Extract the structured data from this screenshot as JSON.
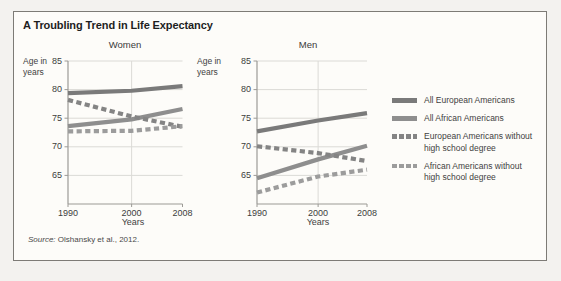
{
  "figure": {
    "title": "A Troubling Trend in Life Expectancy",
    "source_prefix": "Source:",
    "source_text": " Olshansky et al., 2012."
  },
  "colors": {
    "all_european": "#7a7a7a",
    "all_african": "#8e8e8e",
    "european_no_hs": "#848484",
    "african_no_hs": "#9c9c9c",
    "grid": "#dbdad6",
    "axis": "#9c9a96"
  },
  "legend": {
    "items": [
      {
        "label": "All European Americans",
        "style": "solid",
        "color_key": "all_european"
      },
      {
        "label": "All African Americans",
        "style": "solid",
        "color_key": "all_african"
      },
      {
        "label": "European Americans without\nhigh school degree",
        "style": "dashed",
        "color_key": "european_no_hs"
      },
      {
        "label": "African Americans without\nhigh school degree",
        "style": "dashed",
        "color_key": "african_no_hs"
      }
    ]
  },
  "chart_data": [
    {
      "type": "line",
      "title": "Women",
      "ylabel": "Age in\nyears",
      "xlabel": "Years",
      "x": [
        1990,
        2000,
        2008
      ],
      "x_tick_labels": [
        "1990",
        "2000",
        "2008"
      ],
      "y_ticks": [
        85,
        80,
        75,
        70,
        65
      ],
      "xlim": [
        1990,
        2008
      ],
      "ylim": [
        60,
        85
      ],
      "grid": true,
      "series": [
        {
          "name": "All European Americans",
          "style": "solid",
          "color_key": "all_european",
          "values": [
            79.4,
            79.8,
            80.6
          ]
        },
        {
          "name": "All African Americans",
          "style": "solid",
          "color_key": "all_african",
          "values": [
            73.6,
            74.8,
            76.6
          ]
        },
        {
          "name": "European Americans without high school degree",
          "style": "dashed",
          "color_key": "european_no_hs",
          "values": [
            78.2,
            75.3,
            73.5
          ]
        },
        {
          "name": "African Americans without high school degree",
          "style": "dashed",
          "color_key": "african_no_hs",
          "values": [
            72.7,
            72.8,
            73.6
          ]
        }
      ]
    },
    {
      "type": "line",
      "title": "Men",
      "ylabel": "Age in\nyears",
      "xlabel": "Years",
      "x": [
        1990,
        2000,
        2008
      ],
      "x_tick_labels": [
        "1990",
        "2000",
        "2008"
      ],
      "y_ticks": [
        85,
        80,
        75,
        70,
        65
      ],
      "xlim": [
        1990,
        2008
      ],
      "ylim": [
        60,
        85
      ],
      "grid": true,
      "series": [
        {
          "name": "All European Americans",
          "style": "solid",
          "color_key": "all_european",
          "values": [
            72.7,
            74.6,
            75.9
          ]
        },
        {
          "name": "All African Americans",
          "style": "solid",
          "color_key": "all_african",
          "values": [
            64.5,
            67.8,
            70.2
          ]
        },
        {
          "name": "European Americans without high school degree",
          "style": "dashed",
          "color_key": "european_no_hs",
          "values": [
            70.1,
            68.9,
            67.5
          ]
        },
        {
          "name": "African Americans without high school degree",
          "style": "dashed",
          "color_key": "african_no_hs",
          "values": [
            62.0,
            64.8,
            66.0
          ]
        }
      ]
    }
  ]
}
